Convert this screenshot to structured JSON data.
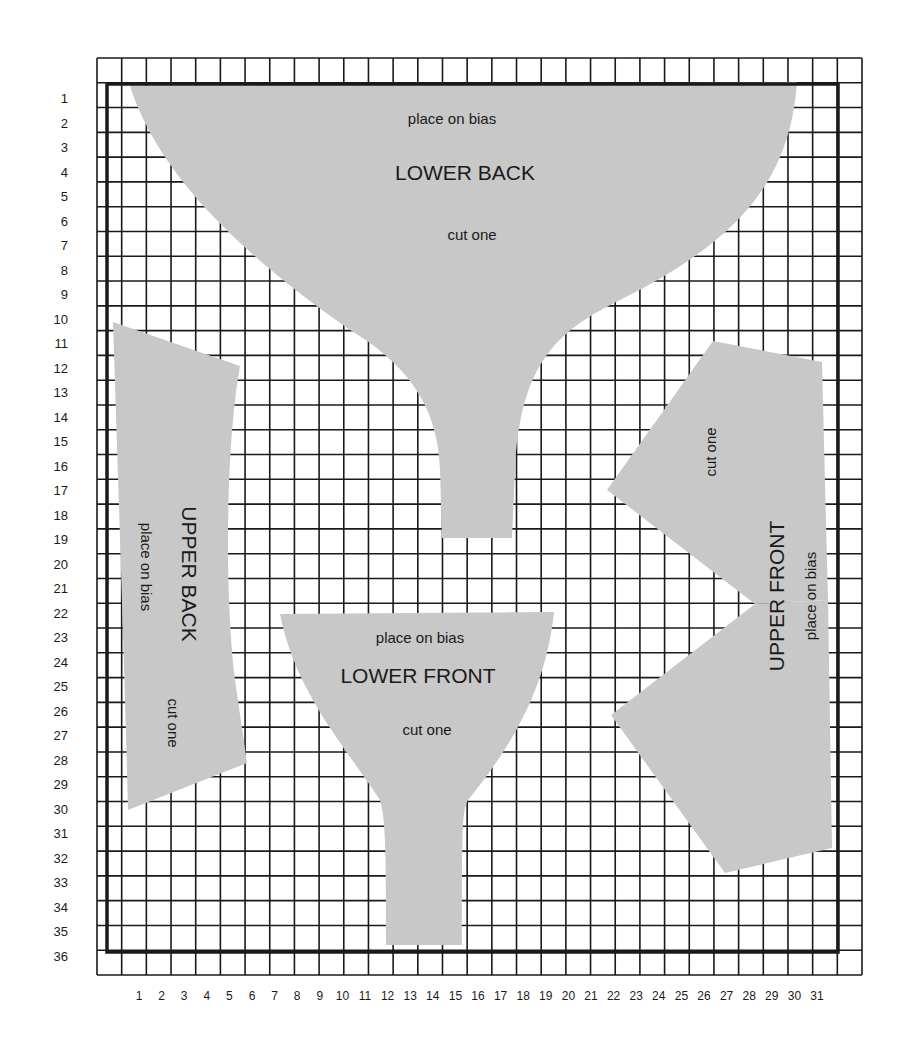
{
  "diagram": {
    "type": "sewing-pattern-grid",
    "grid": {
      "columns": 31,
      "rows": 36,
      "x_labels": [
        "1",
        "2",
        "3",
        "4",
        "5",
        "6",
        "7",
        "8",
        "9",
        "10",
        "11",
        "12",
        "13",
        "14",
        "15",
        "16",
        "17",
        "18",
        "19",
        "20",
        "21",
        "22",
        "23",
        "24",
        "25",
        "26",
        "27",
        "28",
        "29",
        "30",
        "31"
      ],
      "y_labels": [
        "1",
        "2",
        "3",
        "4",
        "5",
        "6",
        "7",
        "8",
        "9",
        "10",
        "11",
        "12",
        "13",
        "14",
        "15",
        "16",
        "17",
        "18",
        "19",
        "20",
        "21",
        "22",
        "23",
        "24",
        "25",
        "26",
        "27",
        "28",
        "29",
        "30",
        "31",
        "32",
        "33",
        "34",
        "35",
        "36"
      ]
    },
    "colors": {
      "piece_fill": "#c8c8c8",
      "grid_line": "#1a1a1a",
      "background": "#ffffff"
    },
    "pieces": {
      "lower_back": {
        "title": "LOWER BACK",
        "note_top": "place on bias",
        "note_bottom": "cut one"
      },
      "upper_back": {
        "title": "UPPER BACK",
        "note_bias": "place on bias",
        "note_cut": "cut one"
      },
      "lower_front": {
        "title": "LOWER FRONT",
        "note_top": "place on bias",
        "note_bottom": "cut one"
      },
      "upper_front": {
        "title": "UPPER FRONT",
        "note_bias": "place on bias",
        "note_cut": "cut one"
      }
    }
  }
}
